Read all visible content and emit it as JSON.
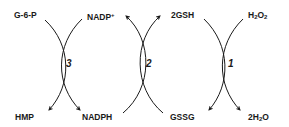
{
  "diagram": {
    "type": "coupled-reaction-cycles",
    "colors": {
      "line": "#1a1a1a",
      "background": "#ffffff"
    },
    "nodes": {
      "g6p": {
        "label": "G-6-P"
      },
      "hmp": {
        "label": "HMP"
      },
      "nadp_plus": {
        "label": "NADP",
        "sup": "+"
      },
      "nadph": {
        "label": "NADPH"
      },
      "gsh": {
        "label": "2GSH"
      },
      "gssg": {
        "label": "GSSG"
      },
      "h2o2": {
        "pre": "H",
        "sub1": "2",
        "mid": "O",
        "sub2": "2"
      },
      "water": {
        "pre": "2H",
        "sub1": "2",
        "mid": "O"
      }
    },
    "reactions": [
      {
        "id": "r3",
        "label": "3",
        "from": [
          "G-6-P",
          "NADP+"
        ],
        "to": [
          "HMP",
          "NADPH"
        ]
      },
      {
        "id": "r2",
        "label": "2",
        "from": [
          "NADPH",
          "GSSG"
        ],
        "to": [
          "NADP+",
          "2GSH"
        ]
      },
      {
        "id": "r1",
        "label": "1",
        "from": [
          "2GSH",
          "H2O2"
        ],
        "to": [
          "GSSG",
          "2H2O"
        ]
      }
    ]
  }
}
